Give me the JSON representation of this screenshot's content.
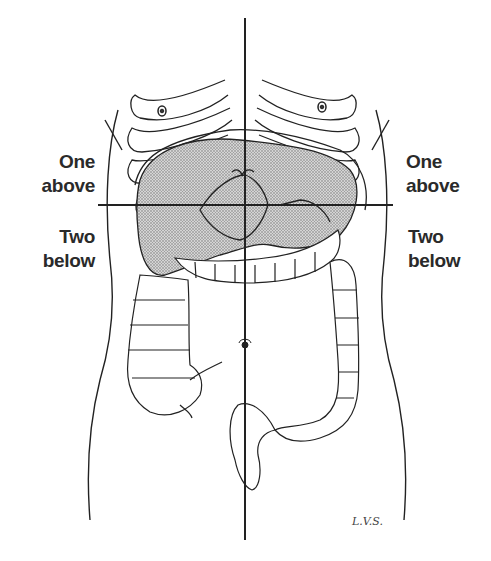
{
  "figure": {
    "labels": {
      "left_upper": [
        "One",
        "above"
      ],
      "left_lower": [
        "Two",
        "below"
      ],
      "right_upper": [
        "One",
        "above"
      ],
      "right_lower": [
        "Two",
        "below"
      ]
    },
    "signature": "L.V.S.",
    "lines": {
      "vertical_midline": {
        "x": 245,
        "y_start": 18,
        "y_end": 540
      },
      "horizontal_line": {
        "y": 205,
        "x_start": 98,
        "x_end": 393
      }
    },
    "colors": {
      "ink": "#222222",
      "shading": "#9a9a9a",
      "background": "#ffffff"
    }
  }
}
